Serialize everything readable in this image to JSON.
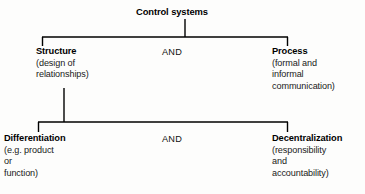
{
  "diagram": {
    "root": {
      "label": "Control systems"
    },
    "operators": {
      "upper": "AND",
      "lower": "AND"
    },
    "tier1": [
      {
        "title": "Structure",
        "desc": [
          "(design of",
          "relationships)"
        ]
      },
      {
        "title": "Process",
        "desc": [
          "(formal and",
          "informal",
          "communication)"
        ]
      }
    ],
    "tier2": [
      {
        "title": "Differentiation",
        "desc": [
          "(e.g. product",
          "or",
          "function)"
        ]
      },
      {
        "title": "Decentralization",
        "desc": [
          "(responsibility",
          "and",
          "accountability)"
        ]
      }
    ],
    "colors": {
      "line": "#000000",
      "text": "#000000",
      "background": "#fdfdfc"
    }
  }
}
